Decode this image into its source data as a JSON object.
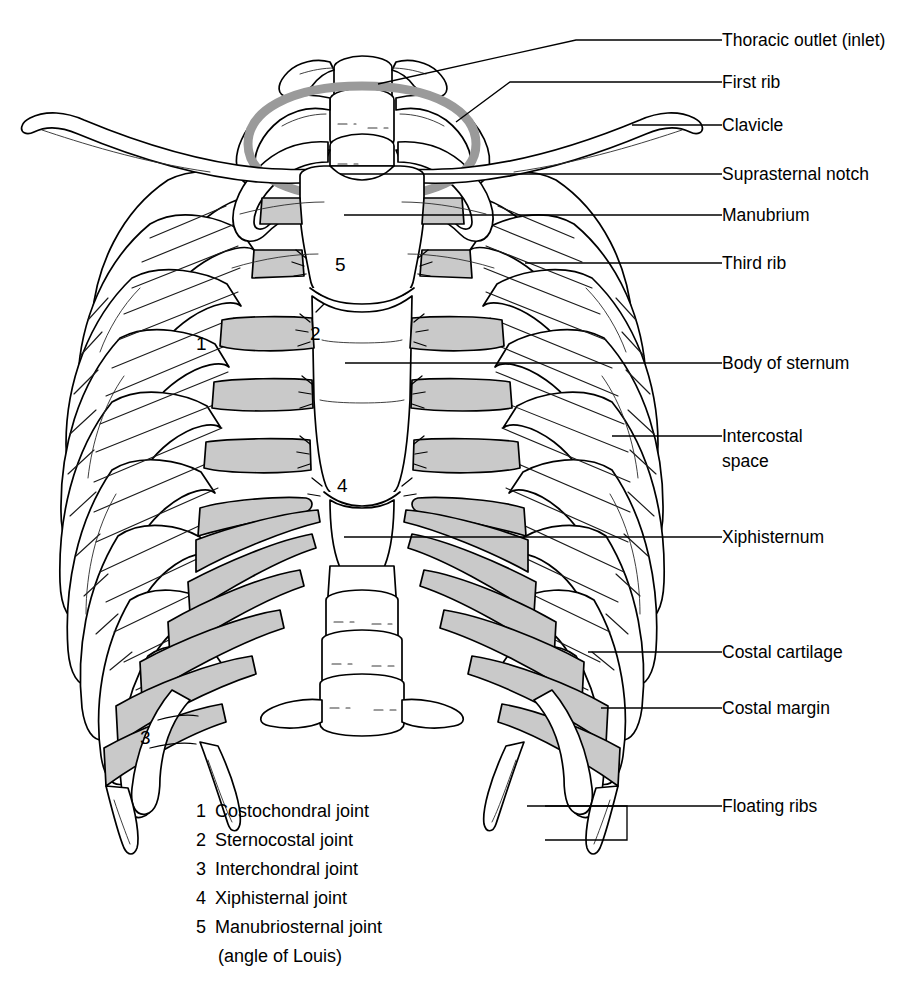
{
  "figure": {
    "background_color": "#ffffff",
    "ink_color": "#000000",
    "cartilage_fill": "#c9c9c9",
    "outlet_ring_color": "#9a9a9a"
  },
  "callouts": [
    {
      "id": "thoracic-outlet",
      "label": "Thoracic outlet (inlet)",
      "text_x": 722,
      "text_y": 46,
      "leader": "M 722 40 L 576 40 L 378 84"
    },
    {
      "id": "first-rib",
      "label": "First rib",
      "text_x": 722,
      "text_y": 88,
      "leader": "M 722 82 L 510 82 L 456 122"
    },
    {
      "id": "clavicle",
      "label": "Clavicle",
      "text_x": 722,
      "text_y": 131,
      "leader": "M 722 125 L 632 125"
    },
    {
      "id": "suprasternal-notch",
      "label": "Suprasternal notch",
      "text_x": 722,
      "text_y": 180,
      "leader": "M 722 174 L 340 174"
    },
    {
      "id": "manubrium",
      "label": "Manubrium",
      "text_x": 722,
      "text_y": 221,
      "leader": "M 722 215 L 344 215"
    },
    {
      "id": "third-rib",
      "label": "Third rib",
      "text_x": 722,
      "text_y": 269,
      "leader": "M 722 263 L 525 263"
    },
    {
      "id": "body-of-sternum",
      "label": "Body of sternum",
      "text_x": 722,
      "text_y": 369,
      "leader": "M 722 363 L 345 363"
    },
    {
      "id": "intercostal-space",
      "label": "Intercostal",
      "label2": "space",
      "text_x": 722,
      "text_y": 442,
      "leader": "M 722 436 L 612 436"
    },
    {
      "id": "xiphisternum",
      "label": "Xiphisternum",
      "text_x": 722,
      "text_y": 543,
      "leader": "M 722 537 L 344 537"
    },
    {
      "id": "costal-cartilage",
      "label": "Costal cartilage",
      "text_x": 722,
      "text_y": 658,
      "leader": "M 722 652 L 588 652"
    },
    {
      "id": "costal-margin",
      "label": "Costal margin",
      "text_x": 722,
      "text_y": 714,
      "leader": "M 722 708 L 601 708"
    },
    {
      "id": "floating-ribs",
      "label": "Floating ribs",
      "text_x": 722,
      "text_y": 812,
      "leader": "M 722 806 L 527 806"
    }
  ],
  "floating_ribs_bracket": "M 545 806 L 627 806 L 627 840 L 545 840",
  "joint_markers": [
    {
      "n": "1",
      "x": 196,
      "y": 350
    },
    {
      "n": "2",
      "x": 310,
      "y": 340
    },
    {
      "n": "3",
      "x": 140,
      "y": 744
    },
    {
      "n": "4",
      "x": 337,
      "y": 492
    },
    {
      "n": "5",
      "x": 335,
      "y": 271
    }
  ],
  "legend": {
    "items": [
      {
        "n": "1",
        "text": "Costochondral joint"
      },
      {
        "n": "2",
        "text": "Sternocostal joint"
      },
      {
        "n": "3",
        "text": "Interchondral joint"
      },
      {
        "n": "4",
        "text": "Xiphisternal joint"
      },
      {
        "n": "5",
        "text": "Manubriosternal joint"
      }
    ],
    "continuation": "(angle of Louis)",
    "x": 196,
    "y_start": 817,
    "line_height": 29
  }
}
